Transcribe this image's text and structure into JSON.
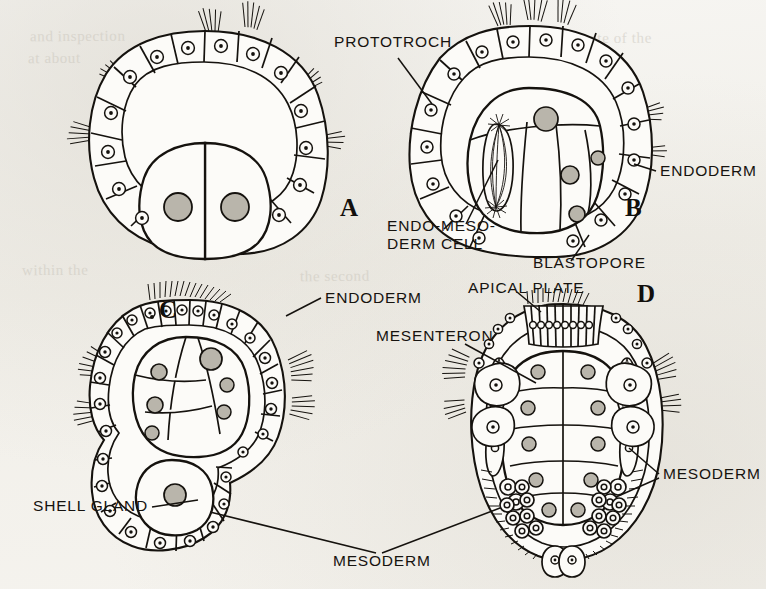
{
  "figure": {
    "kind": "scanned-textbook-diagram",
    "background_color": "#f4f3f0",
    "ink_color": "#15120e",
    "panel_count": 4
  },
  "panels": [
    {
      "letter": "A",
      "letter_x": 694,
      "letter_y": 216,
      "stage": "blastula with prototroch ring and two large endoderm cells"
    },
    {
      "letter": "B",
      "letter_x": 1298,
      "letter_y": 216,
      "stage": "gastrula with blastopore and dividing endo-mesoderm cell"
    },
    {
      "letter": "C",
      "letter_x": 334,
      "letter_y": 318,
      "stage": "later gastrula with shell gland and mesoderm bands"
    },
    {
      "letter": "D",
      "letter_x": 1290,
      "letter_y": 302,
      "stage": "trochophore with apical plate, mesenteron and mesoderm"
    }
  ],
  "labels": [
    {
      "id": "prototroch",
      "text": "PROTOTROCH",
      "x": 334,
      "y": 47,
      "anchor": "start"
    },
    {
      "id": "endoderm-b",
      "text": "ENDODERM",
      "x": 660,
      "y": 176,
      "anchor": "start"
    },
    {
      "id": "endo-mesoderm-cell-line1",
      "text": "ENDO-MESO-",
      "x": 387,
      "y": 231,
      "anchor": "start"
    },
    {
      "id": "endo-mesoderm-cell-line2",
      "text": "DERM CELL",
      "x": 387,
      "y": 249,
      "anchor": "start"
    },
    {
      "id": "blastopore",
      "text": "BLASTOPORE",
      "x": 533,
      "y": 268,
      "anchor": "start"
    },
    {
      "id": "endoderm-c",
      "text": "ENDODERM",
      "x": 325,
      "y": 303,
      "anchor": "start"
    },
    {
      "id": "apical-plate",
      "text": "APICAL PLATE",
      "x": 468,
      "y": 293,
      "anchor": "start"
    },
    {
      "id": "mesenteron",
      "text": "MESENTERON",
      "x": 376,
      "y": 341,
      "anchor": "start"
    },
    {
      "id": "mesoderm-d",
      "text": "MESODERM",
      "x": 663,
      "y": 479,
      "anchor": "start"
    },
    {
      "id": "shell-gland",
      "text": "SHELL GLAND",
      "x": 33,
      "y": 511,
      "anchor": "start"
    },
    {
      "id": "mesoderm-c",
      "text": "MESODERM",
      "x": 333,
      "y": 566,
      "anchor": "start"
    }
  ],
  "bleed_through": [
    {
      "text": "and inspection",
      "x": 30,
      "y": 28,
      "rotate": -0.4
    },
    {
      "text": "the rate of the",
      "x": 560,
      "y": 30,
      "rotate": -0.4
    },
    {
      "text": "at about",
      "x": 28,
      "y": 50,
      "rotate": -0.4
    },
    {
      "text": "of pattern",
      "x": 565,
      "y": 56,
      "rotate": -0.4
    },
    {
      "text": "within the",
      "x": 22,
      "y": 262,
      "rotate": -0.4
    },
    {
      "text": "the second",
      "x": 300,
      "y": 268,
      "rotate": -0.4
    }
  ]
}
